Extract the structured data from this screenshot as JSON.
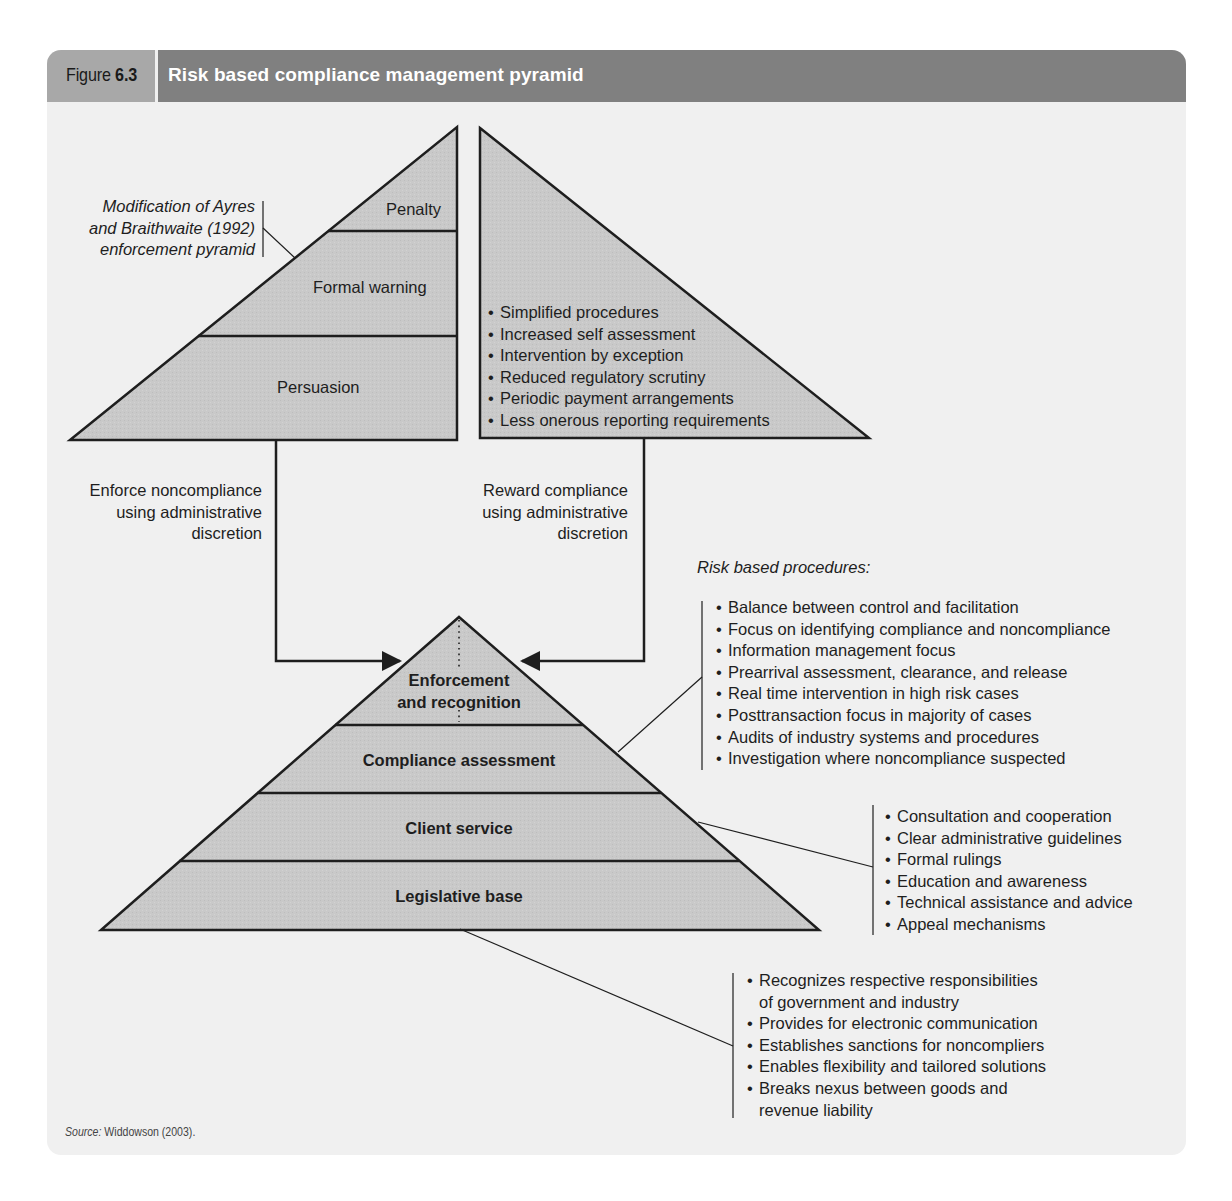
{
  "header": {
    "figure_word": "Figure",
    "figure_number": "6.3",
    "title": "Risk based compliance management pyramid"
  },
  "colors": {
    "panel_bg": "#f0f0f0",
    "header_left_bg": "#a8a8a8",
    "header_right_bg": "#808080",
    "pyramid_fill": "#c9c9c9",
    "stroke": "#1e1e1e"
  },
  "enforcement_pyramid": {
    "annotation": [
      "Modification of Ayres",
      "and Braithwaite (1992)",
      "enforcement pyramid"
    ],
    "levels": [
      "Penalty",
      "Formal warning",
      "Persuasion"
    ]
  },
  "reward_pyramid": {
    "items": [
      "Simplified procedures",
      "Increased self assessment",
      "Intervention by exception",
      "Reduced regulatory scrutiny",
      "Periodic payment arrangements",
      "Less onerous reporting requirements"
    ]
  },
  "connectors": {
    "enforce": [
      "Enforce noncompliance",
      "using administrative",
      "discretion"
    ],
    "reward": [
      "Reward compliance",
      "using administrative",
      "discretion"
    ]
  },
  "main_pyramid": {
    "levels": [
      [
        "Enforcement",
        "and recognition"
      ],
      [
        "Compliance assessment"
      ],
      [
        "Client service"
      ],
      [
        "Legislative base"
      ]
    ]
  },
  "risk_procedures": {
    "heading": "Risk based procedures:",
    "items": [
      "Balance between control and facilitation",
      "Focus on identifying compliance and noncompliance",
      "Information management focus",
      "Prearrival assessment, clearance, and release",
      "Real time intervention in high risk cases",
      "Posttransaction focus in majority of cases",
      "Audits of industry systems and procedures",
      "Investigation where noncompliance suspected"
    ]
  },
  "client_service_items": [
    "Consultation and cooperation",
    "Clear administrative guidelines",
    "Formal rulings",
    "Education and awareness",
    "Technical assistance and advice",
    "Appeal mechanisms"
  ],
  "legislative_items": [
    [
      "Recognizes respective responsibilities",
      "of government and industry"
    ],
    [
      "Provides for electronic communication"
    ],
    [
      "Establishes sanctions for noncompliers"
    ],
    [
      "Enables flexibility and tailored solutions"
    ],
    [
      "Breaks nexus between goods and",
      "revenue liability"
    ]
  ],
  "source": {
    "label": "Source:",
    "text": "Widdowson (2003)."
  }
}
